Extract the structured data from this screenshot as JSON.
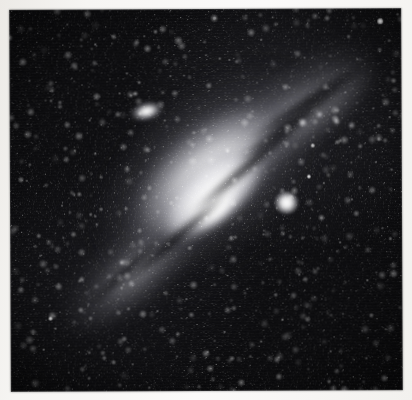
{
  "page": {
    "kind": "photographic-plate-scan",
    "paper_color": "#f6f5f3",
    "sky_color": "#07070a",
    "highlight_color": "#ffffff",
    "width": 412,
    "height": 400
  },
  "photo": {
    "frame": {
      "left": 10,
      "top": 9,
      "width": 392,
      "height": 382
    },
    "subject": "Spiral galaxy (Andromeda, M31) seen at a steep inclination, with two companion galaxies",
    "orientation_degrees": -40,
    "caption": ""
  },
  "objects": {
    "main_galaxy": {
      "name": "main-galaxy",
      "center_x": 203,
      "center_y": 199,
      "major_axis": 340,
      "minor_axis": 232,
      "position_angle": -40,
      "nucleus_center_x": 205,
      "nucleus_center_y": 199
    },
    "companion_upper_left": {
      "name": "companion-galaxy-upper-left",
      "center_x": 147,
      "center_y": 111,
      "width": 38,
      "height": 22,
      "position_angle": -14
    },
    "companion_right": {
      "name": "companion-galaxy-right",
      "center_x": 286,
      "center_y": 203,
      "width": 23,
      "height": 22
    }
  },
  "dust_lanes": [
    {
      "name": "dust-lane-outer-ne",
      "x": 196,
      "y": 104,
      "length": 176,
      "angle": -37
    },
    {
      "name": "dust-lane-far-ne",
      "x": 224,
      "y": 86,
      "length": 150,
      "angle": -33
    },
    {
      "name": "dust-lane-inner-ne",
      "x": 160,
      "y": 146,
      "length": 168,
      "angle": -40
    },
    {
      "name": "dust-lane-inner-sw",
      "x": 88,
      "y": 226,
      "length": 150,
      "angle": -41
    },
    {
      "name": "dust-lane-outer-sw",
      "x": 56,
      "y": 256,
      "length": 120,
      "angle": -43
    }
  ],
  "arm_knots": [
    {
      "x": 303,
      "y": 123,
      "r": 4.2,
      "b": 0.95
    },
    {
      "x": 320,
      "y": 115,
      "r": 3.0,
      "b": 0.8
    },
    {
      "x": 337,
      "y": 122,
      "r": 3.4,
      "b": 0.85
    },
    {
      "x": 352,
      "y": 126,
      "r": 2.6,
      "b": 0.7
    },
    {
      "x": 287,
      "y": 132,
      "r": 2.4,
      "b": 0.65
    },
    {
      "x": 266,
      "y": 141,
      "r": 2.0,
      "b": 0.55
    },
    {
      "x": 247,
      "y": 152,
      "r": 1.8,
      "b": 0.5
    },
    {
      "x": 122,
      "y": 262,
      "r": 2.6,
      "b": 0.7
    },
    {
      "x": 109,
      "y": 276,
      "r": 2.2,
      "b": 0.62
    },
    {
      "x": 140,
      "y": 251,
      "r": 2.0,
      "b": 0.6
    },
    {
      "x": 96,
      "y": 286,
      "r": 1.8,
      "b": 0.5
    },
    {
      "x": 156,
      "y": 243,
      "r": 1.7,
      "b": 0.5
    },
    {
      "x": 86,
      "y": 292,
      "r": 1.5,
      "b": 0.45
    }
  ],
  "stars": [
    {
      "x": 381,
      "y": 22,
      "r": 2.6,
      "b": 1.0
    },
    {
      "x": 309,
      "y": 177,
      "r": 2.2,
      "b": 0.95
    },
    {
      "x": 313,
      "y": 146,
      "r": 1.6,
      "b": 0.8
    },
    {
      "x": 96,
      "y": 44,
      "r": 1.3,
      "b": 0.7
    },
    {
      "x": 50,
      "y": 318,
      "r": 1.7,
      "b": 0.85
    },
    {
      "x": 55,
      "y": 328,
      "r": 1.2,
      "b": 0.6
    },
    {
      "x": 43,
      "y": 349,
      "r": 1.3,
      "b": 0.65
    },
    {
      "x": 282,
      "y": 320,
      "r": 1.4,
      "b": 0.75
    },
    {
      "x": 224,
      "y": 332,
      "r": 1.2,
      "b": 0.6
    },
    {
      "x": 157,
      "y": 311,
      "r": 1.2,
      "b": 0.6
    },
    {
      "x": 186,
      "y": 299,
      "r": 1.0,
      "b": 0.55
    },
    {
      "x": 340,
      "y": 243,
      "r": 1.1,
      "b": 0.55
    },
    {
      "x": 367,
      "y": 281,
      "r": 1.2,
      "b": 0.6
    },
    {
      "x": 352,
      "y": 200,
      "r": 1.0,
      "b": 0.5
    },
    {
      "x": 120,
      "y": 93,
      "r": 1.1,
      "b": 0.55
    },
    {
      "x": 171,
      "y": 76,
      "r": 1.0,
      "b": 0.5
    },
    {
      "x": 230,
      "y": 60,
      "r": 1.1,
      "b": 0.55
    },
    {
      "x": 262,
      "y": 40,
      "r": 1.0,
      "b": 0.5
    },
    {
      "x": 75,
      "y": 150,
      "r": 1.1,
      "b": 0.55
    },
    {
      "x": 62,
      "y": 205,
      "r": 1.0,
      "b": 0.5
    },
    {
      "x": 40,
      "y": 255,
      "r": 1.0,
      "b": 0.5
    },
    {
      "x": 390,
      "y": 118,
      "r": 1.1,
      "b": 0.6
    },
    {
      "x": 376,
      "y": 163,
      "r": 1.0,
      "b": 0.5
    },
    {
      "x": 299,
      "y": 275,
      "r": 1.0,
      "b": 0.5
    },
    {
      "x": 247,
      "y": 289,
      "r": 0.9,
      "b": 0.45
    },
    {
      "x": 207,
      "y": 352,
      "r": 1.0,
      "b": 0.5
    },
    {
      "x": 132,
      "y": 364,
      "r": 0.9,
      "b": 0.45
    },
    {
      "x": 330,
      "y": 352,
      "r": 1.0,
      "b": 0.5
    },
    {
      "x": 90,
      "y": 120,
      "r": 0.9,
      "b": 0.45
    },
    {
      "x": 146,
      "y": 160,
      "r": 0.9,
      "b": 0.4
    },
    {
      "x": 30,
      "y": 80,
      "r": 0.9,
      "b": 0.45
    },
    {
      "x": 358,
      "y": 60,
      "r": 1.0,
      "b": 0.5
    },
    {
      "x": 210,
      "y": 30,
      "r": 0.9,
      "b": 0.45
    },
    {
      "x": 145,
      "y": 36,
      "r": 0.8,
      "b": 0.4
    },
    {
      "x": 290,
      "y": 88,
      "r": 0.9,
      "b": 0.4
    },
    {
      "x": 68,
      "y": 372,
      "r": 0.9,
      "b": 0.4
    },
    {
      "x": 385,
      "y": 330,
      "r": 0.9,
      "b": 0.4
    },
    {
      "x": 27,
      "y": 180,
      "r": 0.8,
      "b": 0.4
    }
  ]
}
